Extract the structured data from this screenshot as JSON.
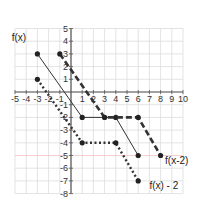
{
  "chart_data": {
    "type": "line",
    "title": "",
    "xlabel": "",
    "ylabel": "",
    "xlim": [
      -5,
      10
    ],
    "ylim": [
      -8,
      5
    ],
    "grid": true,
    "x_ticks": [
      -5,
      -4,
      -3,
      -2,
      -1,
      1,
      2,
      3,
      4,
      5,
      6,
      7,
      8,
      9,
      10
    ],
    "y_ticks": [
      5,
      4,
      3,
      2,
      1,
      -1,
      -2,
      -3,
      -4,
      -5,
      -6,
      -7,
      -8
    ],
    "series": [
      {
        "name": "f(x)",
        "style": "solid",
        "points": [
          [
            -3,
            3
          ],
          [
            1,
            -2
          ],
          [
            4,
            -2
          ],
          [
            6,
            -5
          ]
        ],
        "label_pos": [
          -5.3,
          4.0
        ]
      },
      {
        "name": "f(x-2)",
        "style": "dashed",
        "points": [
          [
            -1,
            3
          ],
          [
            3,
            -2
          ],
          [
            6,
            -2
          ],
          [
            8,
            -5
          ]
        ],
        "label_pos": [
          8.4,
          -5.7
        ]
      },
      {
        "name": "f(x) - 2",
        "style": "dotted",
        "points": [
          [
            -3,
            1
          ],
          [
            1,
            -4
          ],
          [
            4,
            -4
          ],
          [
            6,
            -7
          ]
        ],
        "label_pos": [
          7.0,
          -7.6
        ]
      }
    ],
    "colors": {
      "grid": "#dcdcdc",
      "axis": "#555555",
      "x_axis_highlight": "#c8d89a",
      "y_neg5_highlight": "#f2c4c4",
      "line": "#333333"
    }
  }
}
